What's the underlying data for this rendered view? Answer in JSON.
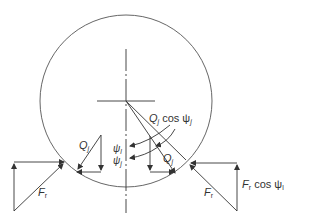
{
  "diagram": {
    "colors": {
      "stroke": "#333333",
      "background": "#ffffff"
    },
    "labels": {
      "q_left": {
        "main": "Q",
        "sub": "j"
      },
      "q_right": {
        "main": "Q",
        "sub": "j"
      },
      "q_cos": {
        "main": "Q",
        "sub": "j",
        "rest": "cos ψ",
        "rest_sub": "j"
      },
      "psi_1": {
        "main": "ψ",
        "sub": "l"
      },
      "psi_j": {
        "main": "ψ",
        "sub": "j"
      },
      "f_left": {
        "main": "F",
        "sub": "r"
      },
      "f_right": {
        "main": "F",
        "sub": "r"
      },
      "f_cos": {
        "main": "F",
        "sub": "r",
        "rest": "cos ψ",
        "rest_sub": "l"
      }
    }
  }
}
